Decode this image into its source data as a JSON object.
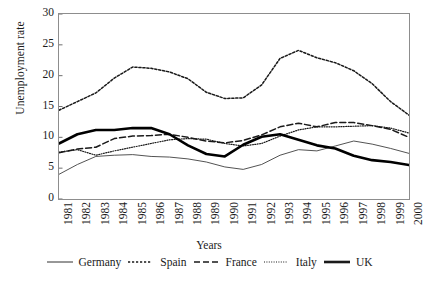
{
  "chart_data": {
    "type": "line",
    "title": "",
    "subtitle": "",
    "xlabel": "Years",
    "ylabel": "Unemployment rate",
    "ylim": [
      0,
      30
    ],
    "yticks": [
      0,
      5,
      10,
      15,
      20,
      25,
      30
    ],
    "grid": false,
    "legend_position": "bottom",
    "categories": [
      "1981",
      "1982",
      "1983",
      "1984",
      "1985",
      "1986",
      "1987",
      "1988",
      "1989",
      "1990",
      "1991",
      "1992",
      "1993",
      "1994",
      "1995",
      "1996",
      "1997",
      "1998",
      "1999",
      "2000"
    ],
    "x": [
      "1981",
      "1982",
      "1983",
      "1984",
      "1985",
      "1986",
      "1987",
      "1988",
      "1989",
      "1990",
      "1991",
      "1992",
      "1993",
      "1994",
      "1995",
      "1996",
      "1997",
      "1998",
      "1999",
      "2000"
    ],
    "series": [
      {
        "name": "Germany",
        "style": "thin-solid",
        "color": "#3f3f3f",
        "values": [
          4.0,
          5.6,
          6.9,
          7.1,
          7.2,
          6.9,
          6.8,
          6.5,
          6.0,
          5.2,
          4.8,
          5.6,
          7.1,
          8.0,
          7.8,
          8.6,
          9.4,
          8.9,
          8.2,
          7.4
        ]
      },
      {
        "name": "Spain",
        "style": "dotted",
        "color": "#1a1a1a",
        "values": [
          14.4,
          15.8,
          17.2,
          19.6,
          21.4,
          21.2,
          20.6,
          19.5,
          17.3,
          16.3,
          16.4,
          18.5,
          22.8,
          24.1,
          22.9,
          22.1,
          20.8,
          18.7,
          15.8,
          13.6
        ]
      },
      {
        "name": "France",
        "style": "dashed",
        "color": "#1a1a1a",
        "values": [
          7.5,
          8.1,
          8.4,
          9.8,
          10.2,
          10.3,
          10.5,
          10.0,
          9.4,
          9.1,
          9.5,
          10.4,
          11.7,
          12.3,
          11.7,
          12.4,
          12.4,
          11.9,
          11.3,
          10.0
        ]
      },
      {
        "name": "Italy",
        "style": "fine-dotted",
        "color": "#1a1a1a",
        "values": [
          7.6,
          8.0,
          7.1,
          7.8,
          8.4,
          9.0,
          9.6,
          9.8,
          9.7,
          9.0,
          8.6,
          9.0,
          10.2,
          11.2,
          11.7,
          11.7,
          11.8,
          11.9,
          11.5,
          10.7
        ]
      },
      {
        "name": "UK",
        "style": "thick-solid",
        "color": "#000000",
        "values": [
          9.0,
          10.5,
          11.2,
          11.2,
          11.5,
          11.5,
          10.5,
          8.7,
          7.3,
          6.9,
          8.8,
          10.1,
          10.5,
          9.6,
          8.7,
          8.2,
          7.0,
          6.3,
          6.0,
          5.5
        ]
      }
    ]
  },
  "axis": {
    "y_title": "Unemployment rate",
    "x_title": "Years",
    "y_tick_labels": [
      "30",
      "25",
      "20",
      "15",
      "10",
      "5",
      "0"
    ],
    "x_tick_labels": [
      "1981",
      "1982",
      "1983",
      "1984",
      "1985",
      "1986",
      "1987",
      "1988",
      "1989",
      "1990",
      "1991",
      "1992",
      "1993",
      "1994",
      "1995",
      "1996",
      "1997",
      "1998",
      "1999",
      "2000"
    ]
  },
  "legend": {
    "items": [
      {
        "label": "Germany",
        "style": "thin-solid"
      },
      {
        "label": "Spain",
        "style": "dotted"
      },
      {
        "label": "France",
        "style": "dashed"
      },
      {
        "label": "Italy",
        "style": "fine-dotted"
      },
      {
        "label": "UK",
        "style": "thick-solid"
      }
    ]
  },
  "colors": {
    "frame": "#8d8d8d",
    "text": "#1a1a1a",
    "background": "#ffffff"
  }
}
